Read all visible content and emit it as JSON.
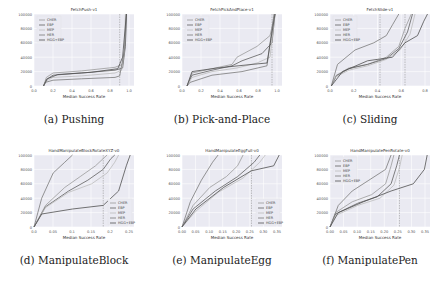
{
  "figure": {
    "captions": [
      "(a) Pushing",
      "(b) Pick-and-Place",
      "(c) Sliding",
      "(d) ManipulateBlock",
      "(e) ManipulateEgg",
      "(f) ManipulatePen"
    ]
  },
  "colors": {
    "plot_bg": "#eaeaf2",
    "grid": "#ffffff",
    "line_gray": "#9a9a9a",
    "line_dark": "#606060",
    "line_light": "#bdbdbd",
    "vline": "#888888"
  },
  "chart_data": [
    {
      "type": "line",
      "title": "FetchPush-v1",
      "xlabel": "Median Success Rate",
      "ylabel": "",
      "xlim": [
        0,
        1.05
      ],
      "ylim": [
        0,
        100000
      ],
      "xticks": [
        "0.0",
        "0.2",
        "0.4",
        "0.6",
        "0.8",
        "1.0"
      ],
      "yticks": [
        "0",
        "20000",
        "40000",
        "60000",
        "80000",
        "100000"
      ],
      "legend": [
        "CHER",
        "EBP",
        "MEP",
        "HER",
        "HGG+EBP"
      ],
      "legend_position": "upper left",
      "vlines": [
        0.9
      ],
      "series": [
        {
          "name": "CHER",
          "x": [
            0.1,
            0.13,
            0.2,
            0.5,
            0.85,
            0.93,
            0.96,
            0.97
          ],
          "y": [
            0,
            12000,
            18000,
            21000,
            26000,
            30000,
            60000,
            100000
          ]
        },
        {
          "name": "EBP",
          "x": [
            0.1,
            0.13,
            0.2,
            0.5,
            0.85,
            0.93,
            0.96,
            0.97
          ],
          "y": [
            0,
            9000,
            15000,
            18000,
            22000,
            25000,
            55000,
            100000
          ]
        },
        {
          "name": "MEP",
          "x": [
            0.1,
            0.13,
            0.2,
            0.5,
            0.85,
            0.92,
            0.95,
            0.96
          ],
          "y": [
            0,
            7000,
            12000,
            14000,
            18000,
            22000,
            50000,
            100000
          ]
        },
        {
          "name": "HER",
          "x": [
            0.1,
            0.12,
            0.2,
            0.5,
            0.85,
            0.9,
            0.95,
            0.97
          ],
          "y": [
            0,
            5000,
            8000,
            10000,
            12000,
            14000,
            50000,
            100000
          ]
        },
        {
          "name": "HGG+EBP",
          "x": [
            0.1,
            0.14,
            0.25,
            0.6,
            0.88,
            0.93,
            0.97
          ],
          "y": [
            0,
            10000,
            16000,
            19000,
            24000,
            40000,
            100000
          ]
        }
      ]
    },
    {
      "type": "line",
      "title": "FetchPickAndPlace-v1",
      "xlabel": "Median Success Rate",
      "ylabel": "",
      "xlim": [
        0,
        1.0
      ],
      "ylim": [
        0,
        100000
      ],
      "xticks": [
        "0.0",
        "0.2",
        "0.4",
        "0.6",
        "0.8",
        "1.0"
      ],
      "yticks": [
        "0",
        "20000",
        "40000",
        "60000",
        "80000",
        "100000"
      ],
      "legend": [
        "CHER",
        "EBP",
        "MEP",
        "HER",
        "HGG+EBP"
      ],
      "legend_position": "upper left",
      "vlines": [
        0.9
      ],
      "series": [
        {
          "name": "CHER",
          "x": [
            0.05,
            0.1,
            0.3,
            0.5,
            0.55,
            0.75,
            0.88,
            0.93
          ],
          "y": [
            0,
            18000,
            24000,
            30000,
            40000,
            55000,
            70000,
            100000
          ]
        },
        {
          "name": "EBP",
          "x": [
            0.05,
            0.1,
            0.3,
            0.5,
            0.6,
            0.8,
            0.9,
            0.93
          ],
          "y": [
            0,
            15000,
            22000,
            28000,
            35000,
            45000,
            60000,
            100000
          ]
        },
        {
          "name": "MEP",
          "x": [
            0.05,
            0.1,
            0.3,
            0.55,
            0.75,
            0.88,
            0.93
          ],
          "y": [
            0,
            12000,
            20000,
            25000,
            32000,
            40000,
            100000
          ]
        },
        {
          "name": "HER",
          "x": [
            0.05,
            0.08,
            0.3,
            0.6,
            0.85,
            0.92
          ],
          "y": [
            0,
            5000,
            15000,
            20000,
            28000,
            100000
          ]
        },
        {
          "name": "HGG+EBP",
          "x": [
            0.05,
            0.1,
            0.35,
            0.7,
            0.85,
            0.93
          ],
          "y": [
            0,
            20000,
            25000,
            30000,
            32000,
            100000
          ]
        }
      ]
    },
    {
      "type": "line",
      "title": "FetchSlide-v1",
      "xlabel": "Median Success Rate",
      "ylabel": "",
      "xlim": [
        0,
        0.8
      ],
      "ylim": [
        0,
        100000
      ],
      "xticks": [
        "0.0",
        "0.2",
        "0.4",
        "0.6",
        "0.8"
      ],
      "yticks": [
        "0",
        "20000",
        "40000",
        "60000",
        "80000",
        "100000"
      ],
      "legend": [
        "CHER",
        "EBP",
        "MEP",
        "HER",
        "HGG+EBP"
      ],
      "legend_position": "upper left",
      "vlines": [
        0.4,
        0.6
      ],
      "series": [
        {
          "name": "CHER",
          "x": [
            0.01,
            0.05,
            0.15,
            0.3,
            0.45,
            0.55,
            0.6,
            0.65
          ],
          "y": [
            0,
            15000,
            25000,
            30000,
            40000,
            55000,
            80000,
            100000
          ]
        },
        {
          "name": "EBP",
          "x": [
            0.01,
            0.05,
            0.15,
            0.3,
            0.45,
            0.55,
            0.62,
            0.66
          ],
          "y": [
            0,
            14000,
            24000,
            30000,
            38000,
            52000,
            75000,
            100000
          ]
        },
        {
          "name": "MEP",
          "x": [
            0.01,
            0.04,
            0.15,
            0.3,
            0.45,
            0.56,
            0.64,
            0.68
          ],
          "y": [
            0,
            12000,
            22000,
            28000,
            37000,
            50000,
            72000,
            100000
          ]
        },
        {
          "name": "HER",
          "x": [
            0.01,
            0.06,
            0.2,
            0.35,
            0.45,
            0.5,
            0.55
          ],
          "y": [
            0,
            30000,
            50000,
            60000,
            70000,
            85000,
            100000
          ]
        },
        {
          "name": "HGG+EBP",
          "x": [
            0.01,
            0.1,
            0.3,
            0.5,
            0.6,
            0.7,
            0.75,
            0.78
          ],
          "y": [
            0,
            20000,
            35000,
            40000,
            60000,
            70000,
            90000,
            100000
          ]
        }
      ]
    },
    {
      "type": "line",
      "title": "HandManipulateBlockRotateXYZ-v0",
      "xlabel": "Median Success Rate",
      "ylabel": "",
      "xlim": [
        0,
        0.26
      ],
      "ylim": [
        0,
        100000
      ],
      "xticks": [
        "0.0",
        "0.05",
        "0.1",
        "0.15",
        "0.2",
        "0.25"
      ],
      "yticks": [
        "0",
        "20000",
        "40000",
        "60000",
        "80000",
        "100000"
      ],
      "legend": [
        "CHER",
        "EBP",
        "MEP",
        "HER",
        "HGG+EBP"
      ],
      "legend_position": "lower right",
      "vlines": [
        0.18
      ],
      "series": [
        {
          "name": "CHER",
          "x": [
            0.0,
            0.03,
            0.08,
            0.12,
            0.16,
            0.18,
            0.19
          ],
          "y": [
            0,
            30000,
            55000,
            70000,
            85000,
            95000,
            100000
          ]
        },
        {
          "name": "EBP",
          "x": [
            0.0,
            0.03,
            0.09,
            0.14,
            0.18,
            0.2,
            0.21
          ],
          "y": [
            0,
            28000,
            50000,
            65000,
            80000,
            95000,
            100000
          ]
        },
        {
          "name": "MEP",
          "x": [
            0.0,
            0.03,
            0.09,
            0.15,
            0.19,
            0.21,
            0.22
          ],
          "y": [
            0,
            27000,
            48000,
            60000,
            75000,
            90000,
            100000
          ]
        },
        {
          "name": "HER",
          "x": [
            0.0,
            0.02,
            0.05,
            0.08,
            0.1
          ],
          "y": [
            0,
            40000,
            75000,
            90000,
            100000
          ]
        },
        {
          "name": "HGG+EBP",
          "x": [
            0.0,
            0.02,
            0.1,
            0.18,
            0.22,
            0.24,
            0.25
          ],
          "y": [
            0,
            18000,
            25000,
            30000,
            50000,
            85000,
            100000
          ]
        }
      ]
    },
    {
      "type": "line",
      "title": "HandManipulateEggFull-v0",
      "xlabel": "Median Success Rate",
      "ylabel": "",
      "xlim": [
        0,
        0.36
      ],
      "ylim": [
        0,
        100000
      ],
      "xticks": [
        "0.00",
        "0.05",
        "0.10",
        "0.15",
        "0.20",
        "0.25",
        "0.30",
        "0.35"
      ],
      "yticks": [
        "0",
        "20000",
        "40000",
        "60000",
        "80000",
        "100000"
      ],
      "legend": [
        "CHER",
        "EBP",
        "MEP",
        "HER",
        "HGG+EBP"
      ],
      "legend_position": "lower right",
      "vlines": [
        0.25
      ],
      "series": [
        {
          "name": "CHER",
          "x": [
            0.0,
            0.04,
            0.1,
            0.16,
            0.2,
            0.22
          ],
          "y": [
            0,
            30000,
            55000,
            70000,
            85000,
            100000
          ]
        },
        {
          "name": "EBP",
          "x": [
            0.0,
            0.04,
            0.12,
            0.2,
            0.26,
            0.28
          ],
          "y": [
            0,
            25000,
            50000,
            70000,
            90000,
            100000
          ]
        },
        {
          "name": "MEP",
          "x": [
            0.0,
            0.05,
            0.13,
            0.22,
            0.28,
            0.3
          ],
          "y": [
            0,
            22000,
            48000,
            68000,
            90000,
            100000
          ]
        },
        {
          "name": "HER",
          "x": [
            0.0,
            0.03,
            0.07,
            0.11,
            0.13
          ],
          "y": [
            0,
            35000,
            65000,
            90000,
            100000
          ]
        },
        {
          "name": "HGG+EBP",
          "x": [
            0.0,
            0.05,
            0.15,
            0.25,
            0.33,
            0.35
          ],
          "y": [
            0,
            25000,
            55000,
            78000,
            85000,
            100000
          ]
        }
      ]
    },
    {
      "type": "line",
      "title": "HandManipulatePenRotate-v0",
      "xlabel": "Median Success Rate",
      "ylabel": "",
      "xlim": [
        0,
        0.36
      ],
      "ylim": [
        0,
        100000
      ],
      "xticks": [
        "0.00",
        "0.05",
        "0.10",
        "0.15",
        "0.20",
        "0.25",
        "0.30",
        "0.35"
      ],
      "yticks": [
        "0",
        "20000",
        "40000",
        "60000",
        "80000",
        "100000"
      ],
      "legend": [
        "CHER",
        "EBP",
        "MEP",
        "HER",
        "HGG+EBP"
      ],
      "legend_position": "upper left",
      "vlines": [
        0.25
      ],
      "series": [
        {
          "name": "CHER",
          "x": [
            0.0,
            0.02,
            0.08,
            0.15,
            0.2,
            0.22,
            0.23
          ],
          "y": [
            0,
            20000,
            35000,
            45000,
            60000,
            85000,
            100000
          ]
        },
        {
          "name": "EBP",
          "x": [
            0.0,
            0.02,
            0.1,
            0.17,
            0.22,
            0.24,
            0.25
          ],
          "y": [
            0,
            18000,
            33000,
            42000,
            60000,
            85000,
            100000
          ]
        },
        {
          "name": "MEP",
          "x": [
            0.0,
            0.02,
            0.1,
            0.18,
            0.23,
            0.25,
            0.26
          ],
          "y": [
            0,
            16000,
            30000,
            40000,
            58000,
            82000,
            100000
          ]
        },
        {
          "name": "HER",
          "x": [
            0.0,
            0.03,
            0.08,
            0.14,
            0.2,
            0.22
          ],
          "y": [
            0,
            30000,
            50000,
            65000,
            80000,
            100000
          ]
        },
        {
          "name": "HGG+EBP",
          "x": [
            0.0,
            0.03,
            0.12,
            0.22,
            0.3,
            0.34,
            0.35
          ],
          "y": [
            0,
            20000,
            35000,
            50000,
            60000,
            80000,
            100000
          ]
        }
      ]
    }
  ]
}
